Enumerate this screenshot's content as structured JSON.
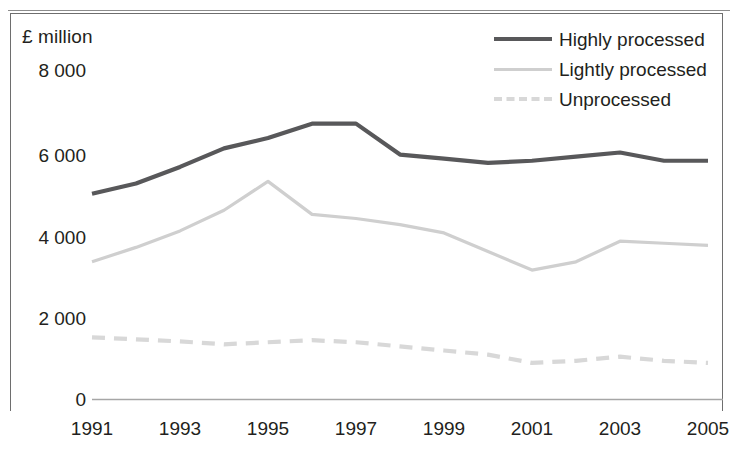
{
  "chart_data": {
    "type": "line",
    "title": "",
    "xlabel": "",
    "ylabel": "£ million",
    "x": [
      1991,
      1992,
      1993,
      1994,
      1995,
      1996,
      1997,
      1998,
      1999,
      2000,
      2001,
      2002,
      2003,
      2004,
      2005
    ],
    "categories": [
      "1991",
      "1992",
      "1993",
      "1994",
      "1995",
      "1996",
      "1997",
      "1998",
      "1999",
      "2000",
      "2001",
      "2002",
      "2003",
      "2004",
      "2005"
    ],
    "xtick_labels": [
      "1991",
      "1993",
      "1995",
      "1997",
      "1999",
      "2001",
      "2003",
      "2005"
    ],
    "ytick_labels": [
      "8 000",
      "6 000",
      "4 000",
      "2 000",
      "0"
    ],
    "ylim": [
      0,
      8000
    ],
    "xlim": [
      1991,
      2005
    ],
    "ytick_values": [
      8000,
      6000,
      4000,
      2000,
      0
    ],
    "grid": false,
    "legend_position": "top-right",
    "series": [
      {
        "name": "Highly processed",
        "color": "#58585a",
        "style": "solid",
        "values": [
          5000,
          5250,
          5650,
          6100,
          6350,
          6700,
          6700,
          5950,
          5850,
          5750,
          5800,
          5900,
          6000,
          5800,
          5800
        ]
      },
      {
        "name": "Lightly processed",
        "color": "#cfcfcf",
        "style": "solid",
        "values": [
          3350,
          3700,
          4100,
          4600,
          5300,
          4500,
          4400,
          4250,
          4050,
          3600,
          3150,
          3350,
          3850,
          3800,
          3750
        ]
      },
      {
        "name": "Unprocessed",
        "color": "#d8d8d8",
        "style": "dashed",
        "values": [
          1520,
          1470,
          1420,
          1350,
          1400,
          1450,
          1400,
          1300,
          1200,
          1100,
          900,
          950,
          1050,
          950,
          900
        ]
      }
    ]
  },
  "axis": {
    "y_title": "£ million"
  },
  "legend": {
    "items": [
      {
        "label": "Highly processed"
      },
      {
        "label": "Lightly processed"
      },
      {
        "label": "Unprocessed"
      }
    ]
  }
}
